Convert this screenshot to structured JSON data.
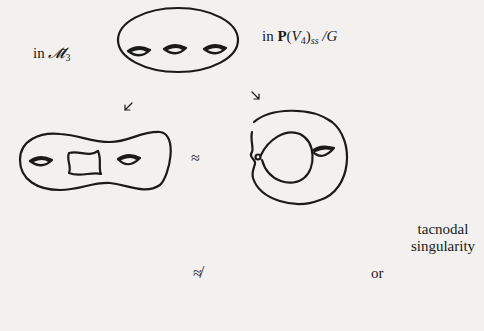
{
  "figure": {
    "labels": {
      "left_space_prefix": "in",
      "left_space_symbol": "𝓜̄",
      "left_space_subscript": "3",
      "right_space_prefix": "in",
      "right_space_P": "P",
      "right_space_open": "(",
      "right_space_V": "V",
      "right_space_V_sub": "4",
      "right_space_close": ")",
      "right_space_ss": "ss",
      "right_space_quot": "/G"
    },
    "relations": {
      "middle": "≈",
      "bottom": "≉",
      "or": "or"
    },
    "annotation": {
      "line1": "tacnodal",
      "line2": "singularity"
    },
    "surfaces": [
      {
        "id": "genus3-smooth",
        "position": "top-center",
        "handles": 3
      },
      {
        "id": "degenerating-left",
        "position": "middle-left",
        "handles": 2,
        "note": "central pinched region"
      },
      {
        "id": "degenerating-right",
        "position": "middle-right",
        "handles": 1,
        "note": "node with small circle"
      },
      {
        "id": "stable-curve-left",
        "position": "bottom-left",
        "handles": 2,
        "note": "two components meeting at two points"
      },
      {
        "id": "tacnodal-curve",
        "position": "bottom-center",
        "handles": 1,
        "note": "tacnode"
      },
      {
        "id": "tacnode-local",
        "position": "bottom-right",
        "note": "local picture of tacnodal singularity"
      }
    ],
    "arrows": [
      "top-to-middle-left",
      "top-to-middle-right",
      "middle-left-down",
      "middle-right-down",
      "annotation-pointer"
    ]
  }
}
